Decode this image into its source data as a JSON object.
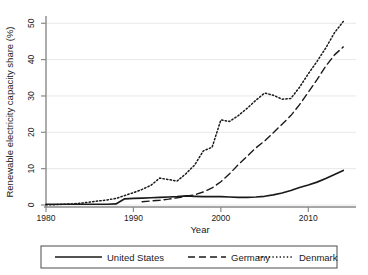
{
  "chart_data": {
    "type": "line",
    "title": "",
    "xlabel": "Year",
    "ylabel": "Renewable electricity capacity share (%)",
    "xlim": [
      1980,
      2015
    ],
    "ylim": [
      0,
      52
    ],
    "xticks": [
      1980,
      1990,
      2000,
      2010
    ],
    "yticks": [
      0,
      10,
      20,
      30,
      40,
      50
    ],
    "xtick_labels": [
      "1980",
      "1990",
      "2000",
      "2010"
    ],
    "ytick_labels": [
      "0",
      "10",
      "20",
      "30",
      "40",
      "50"
    ],
    "grid": "horizontal",
    "legend_position": "below",
    "x": [
      1980,
      1981,
      1982,
      1983,
      1984,
      1985,
      1986,
      1987,
      1988,
      1989,
      1990,
      1991,
      1992,
      1993,
      1994,
      1995,
      1996,
      1997,
      1998,
      1999,
      2000,
      2001,
      2002,
      2003,
      2004,
      2005,
      2006,
      2007,
      2008,
      2009,
      2010,
      2011,
      2012,
      2013,
      2014
    ],
    "series": [
      {
        "name": "United States",
        "style": "solid",
        "color": "#1a1a1a",
        "values": [
          0.2,
          0.2,
          0.2,
          0.2,
          0.2,
          0.2,
          0.2,
          0.2,
          0.3,
          1.7,
          1.8,
          1.9,
          2.0,
          2.1,
          2.2,
          2.3,
          2.5,
          2.4,
          2.3,
          2.3,
          2.3,
          2.2,
          2.1,
          2.1,
          2.2,
          2.4,
          2.8,
          3.3,
          4.0,
          4.8,
          5.5,
          6.3,
          7.3,
          8.4,
          9.5
        ]
      },
      {
        "name": "Germany",
        "style": "dashed",
        "color": "#1a1a1a",
        "values": [
          null,
          null,
          null,
          null,
          null,
          null,
          null,
          null,
          null,
          null,
          null,
          0.9,
          1.1,
          1.3,
          1.6,
          2.0,
          2.4,
          2.8,
          3.6,
          4.7,
          6.4,
          8.6,
          11.1,
          13.4,
          15.7,
          17.6,
          19.9,
          22.2,
          24.6,
          27.6,
          31.0,
          34.5,
          38.2,
          41.3,
          43.5
        ]
      },
      {
        "name": "Denmark",
        "style": "dotted",
        "color": "#1a1a1a",
        "values": [
          0.1,
          0.1,
          0.2,
          0.3,
          0.5,
          0.8,
          1.1,
          1.4,
          1.8,
          2.6,
          3.4,
          4.3,
          5.4,
          7.4,
          7.0,
          6.6,
          8.6,
          11.0,
          14.9,
          15.9,
          23.4,
          23.0,
          24.6,
          26.6,
          28.8,
          30.8,
          30.2,
          29.1,
          29.3,
          32.4,
          36.1,
          39.5,
          43.2,
          47.4,
          50.5
        ]
      }
    ]
  },
  "legend": {
    "items": [
      {
        "label": "United States",
        "style": "solid"
      },
      {
        "label": "Germany",
        "style": "dashed"
      },
      {
        "label": "Denmark",
        "style": "dotted"
      }
    ]
  }
}
